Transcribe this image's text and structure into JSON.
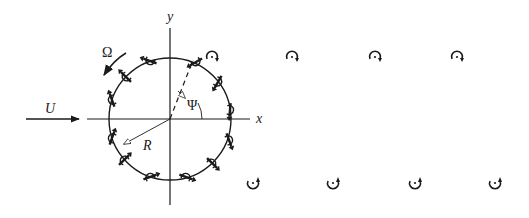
{
  "diagram": {
    "labels": {
      "x_axis": "x",
      "y_axis": "y",
      "freestream": "U",
      "rotation": "Ω",
      "radius": "R",
      "angle": "Ψ"
    },
    "geometry": {
      "center": [
        170,
        119
      ],
      "radius": 61
    },
    "wake_vortices": {
      "upper_row": [
        [
          212,
          57
        ],
        [
          292,
          57
        ],
        [
          375,
          57
        ],
        [
          457,
          57
        ]
      ],
      "upper_row_sense": "clockwise",
      "lower_row": [
        [
          253,
          183
        ],
        [
          333,
          183
        ],
        [
          415,
          183
        ],
        [
          495,
          183
        ]
      ],
      "lower_row_sense": "counter-clockwise"
    },
    "colors": {
      "ink": "#1a1a1a",
      "background": "#ffffff"
    }
  }
}
